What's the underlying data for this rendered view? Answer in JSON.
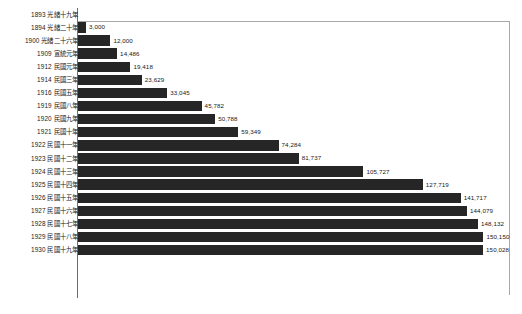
{
  "chart_data": {
    "type": "bar",
    "orientation": "horizontal",
    "title": "",
    "subtitle": "",
    "xlabel": "",
    "ylabel": "",
    "grid": false,
    "legend": null,
    "xlim": [
      0,
      160000
    ],
    "axis_frame": "top-right border with left category axis",
    "categories": [
      "1893 光緒十九年",
      "1894 光緒二十年",
      "1900 光緒二十六年",
      "1909 宣統元年",
      "1912 民國元年",
      "1914 民國三年",
      "1916 民國五年",
      "1919 民國八年",
      "1920 民國九年",
      "1921 民國十年",
      "1922 民國十一年",
      "1923 民國十二年",
      "1924 民國十三年",
      "1925 民國十四年",
      "1926 民國十五年",
      "1927 民國十六年",
      "1928 民國十七年",
      "1929 民國十八年",
      "1930 民國十九年"
    ],
    "values": [
      0,
      3000,
      12000,
      14486,
      19418,
      23629,
      33045,
      45782,
      50788,
      59349,
      74284,
      81737,
      105727,
      127719,
      141717,
      144079,
      148132,
      150150,
      150028
    ],
    "value_labels": [
      "",
      "3,000",
      "12,000",
      "14,486",
      "19,418",
      "23,629",
      "33,045",
      "45,782",
      "50,788",
      "59,349",
      "74,284",
      "81,737",
      "105,727",
      "127,719",
      "141,717",
      "144,079",
      "148,132",
      "150,150",
      "150,028"
    ],
    "bar_color": "#262626",
    "series": [
      {
        "name": "",
        "values": [
          0,
          3000,
          12000,
          14486,
          19418,
          23629,
          33045,
          45782,
          50788,
          59349,
          74284,
          81737,
          105727,
          127719,
          141717,
          144079,
          148132,
          150150,
          150028
        ]
      }
    ]
  },
  "colors": {
    "bar": "#262626",
    "frame": "#a8a8a8",
    "axis": "#6e6e6e",
    "text": "#1a1a1a",
    "background": "#ffffff"
  }
}
